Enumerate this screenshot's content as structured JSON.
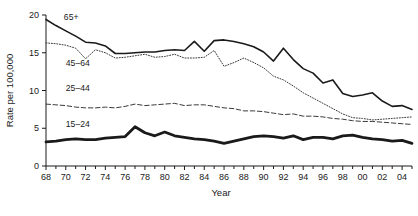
{
  "chart_data": {
    "type": "line",
    "title": "",
    "xlabel": "Year",
    "ylabel": "Rate per 100,000",
    "xlim": [
      1968,
      2005
    ],
    "ylim": [
      0,
      20
    ],
    "ytick_values": [
      0,
      5,
      10,
      15,
      20
    ],
    "ytick_labels": [
      "0",
      "5",
      "10",
      "15",
      "20"
    ],
    "xtick_values": [
      1968,
      1969,
      1970,
      1971,
      1972,
      1973,
      1974,
      1975,
      1976,
      1977,
      1978,
      1979,
      1980,
      1981,
      1982,
      1983,
      1984,
      1985,
      1986,
      1987,
      1988,
      1989,
      1990,
      1991,
      1992,
      1993,
      1994,
      1995,
      1996,
      1997,
      1998,
      1999,
      2000,
      2001,
      2002,
      2003,
      2004,
      2005
    ],
    "xtick_labeled": [
      1968,
      1970,
      1972,
      1974,
      1976,
      1978,
      1980,
      1982,
      1984,
      1986,
      1988,
      1990,
      1992,
      1994,
      1996,
      1998,
      2000,
      2002,
      2004
    ],
    "xtick_labels": [
      "68",
      "70",
      "72",
      "74",
      "76",
      "78",
      "80",
      "82",
      "84",
      "86",
      "88",
      "90",
      "92",
      "94",
      "96",
      "98",
      "00",
      "02",
      "04"
    ],
    "grid": false,
    "legend_position": "inline-annotations",
    "x": [
      1968,
      1969,
      1970,
      1971,
      1972,
      1973,
      1974,
      1975,
      1976,
      1977,
      1978,
      1979,
      1980,
      1981,
      1982,
      1983,
      1984,
      1985,
      1986,
      1987,
      1988,
      1989,
      1990,
      1991,
      1992,
      1993,
      1994,
      1995,
      1996,
      1997,
      1998,
      1999,
      2000,
      2001,
      2002,
      2003,
      2004,
      2005
    ],
    "series": [
      {
        "name": "65+",
        "label": "65+",
        "style": "solid",
        "linewidth": 1.6,
        "color": "#1a1a1a",
        "values": [
          19.4,
          18.6,
          17.9,
          17.2,
          16.4,
          16.3,
          15.9,
          14.9,
          14.9,
          15.0,
          15.1,
          15.1,
          15.3,
          15.4,
          15.3,
          16.5,
          15.2,
          16.6,
          16.7,
          16.5,
          16.2,
          15.8,
          15.1,
          13.9,
          15.6,
          14.1,
          12.9,
          12.3,
          11.0,
          11.4,
          9.6,
          9.2,
          9.4,
          9.7,
          8.6,
          7.9,
          8.0,
          7.5
        ],
        "annotation_xy": [
          1969.2,
          19.8
        ]
      },
      {
        "name": "45-64",
        "label": "45–64",
        "style": "dotted",
        "linewidth": 1.0,
        "color": "#3a3a3a",
        "values": [
          16.3,
          16.2,
          16.0,
          15.6,
          14.2,
          15.4,
          15.0,
          14.3,
          14.4,
          14.6,
          14.8,
          14.4,
          14.5,
          14.8,
          14.3,
          14.3,
          14.4,
          15.3,
          13.2,
          13.7,
          14.3,
          13.7,
          13.0,
          11.9,
          11.4,
          10.6,
          9.7,
          9.0,
          8.3,
          7.6,
          6.9,
          6.4,
          6.3,
          6.1,
          6.2,
          6.3,
          6.4,
          6.5
        ],
        "annotation_xy": [
          1969.4,
          13.6
        ]
      },
      {
        "name": "25-44",
        "label": "25–44",
        "style": "dashed",
        "linewidth": 1.0,
        "color": "#3a3a3a",
        "values": [
          8.2,
          8.1,
          8.0,
          7.8,
          7.7,
          7.7,
          7.8,
          7.7,
          7.9,
          8.2,
          8.0,
          8.1,
          8.2,
          8.3,
          8.0,
          8.1,
          8.1,
          7.9,
          7.7,
          7.6,
          7.3,
          7.3,
          7.2,
          7.0,
          6.8,
          6.9,
          6.6,
          6.6,
          6.5,
          6.3,
          6.2,
          6.0,
          5.9,
          5.9,
          5.8,
          5.7,
          5.6,
          5.5
        ],
        "annotation_xy": [
          1969.4,
          10.3
        ]
      },
      {
        "name": "15-24",
        "label": "15–24",
        "style": "solid",
        "linewidth": 2.8,
        "color": "#1a1a1a",
        "values": [
          3.2,
          3.3,
          3.5,
          3.6,
          3.5,
          3.5,
          3.7,
          3.8,
          3.9,
          5.2,
          4.4,
          4.0,
          4.5,
          4.0,
          3.8,
          3.6,
          3.5,
          3.3,
          3.0,
          3.3,
          3.6,
          3.9,
          4.0,
          3.9,
          3.7,
          4.0,
          3.5,
          3.8,
          3.8,
          3.6,
          4.0,
          4.1,
          3.8,
          3.6,
          3.5,
          3.3,
          3.4,
          3.0
        ],
        "annotation_xy": [
          1969.4,
          5.6
        ]
      }
    ]
  },
  "caption": {
    "partial_text": ""
  }
}
